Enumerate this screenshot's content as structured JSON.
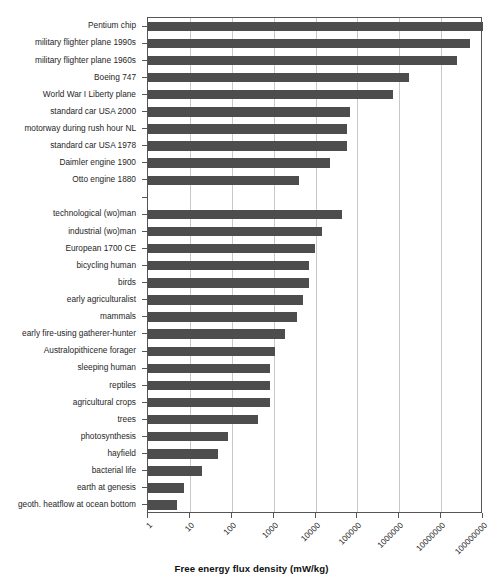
{
  "chart_data": {
    "type": "bar",
    "orientation": "horizontal",
    "title": "",
    "xlabel": "Free energy flux density (mW/kg)",
    "ylabel": "",
    "xscale": "log",
    "xlim": [
      1,
      100000000
    ],
    "xticks": [
      1,
      10,
      100,
      1000,
      10000,
      100000,
      1000000,
      10000000,
      100000000
    ],
    "xticklabels": [
      "1",
      "10",
      "100",
      "1000",
      "10000",
      "100000",
      "1000000",
      "10000000",
      "100000000"
    ],
    "grid": "vertical",
    "legend": "none",
    "bar_color": "#4d4d4d",
    "categories": [
      "Pentium chip",
      "military flighter plane 1990s",
      "military flighter plane 1960s",
      "Boeing 747",
      "World War I Liberty plane",
      "standard car USA 2000",
      "motorway during rush hour NL",
      "standard car USA 1978",
      "Daimler engine 1900",
      "Otto engine 1880",
      "",
      "technological (wo)man",
      "industrial (wo)man",
      "European 1700 CE",
      "bicycling human",
      "birds",
      "early agriculturalist",
      "mammals",
      "early fire-using gatherer-hunter",
      "Australopithicene forager",
      "sleeping human",
      "reptiles",
      "agricultural crops",
      "trees",
      "photosynthesis",
      "hayfield",
      "bacterial life",
      "earth at genesis",
      "geoth. heatflow at ocean bottom"
    ],
    "values": [
      100000000,
      50000000,
      24000000,
      1700000,
      700000,
      68000,
      57000,
      55000,
      22000,
      4000,
      null,
      44000,
      14000,
      9600,
      6900,
      6900,
      5000,
      3600,
      1900,
      1100,
      820,
      820,
      820,
      430,
      83,
      48,
      19,
      7.1,
      4.9
    ]
  }
}
